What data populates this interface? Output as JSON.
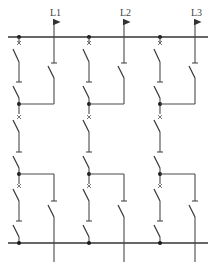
{
  "diagram": {
    "type": "electrical-schematic",
    "colors": {
      "line": "#4a4a4a",
      "background": "#ffffff"
    },
    "phases": [
      {
        "label": "L1",
        "x_left": 19,
        "x_right": 54
      },
      {
        "label": "L2",
        "x_left": 89,
        "x_right": 124
      },
      {
        "label": "L3",
        "x_left": 160,
        "x_right": 195
      }
    ],
    "busbars": [
      {
        "name": "top-bus",
        "y": 37
      },
      {
        "name": "bottom-bus",
        "y": 243
      }
    ]
  }
}
